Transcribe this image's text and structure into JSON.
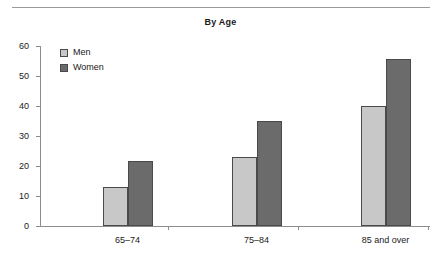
{
  "chart_data": {
    "type": "bar",
    "title": "By Age",
    "xlabel": "",
    "ylabel": "",
    "categories": [
      "65–74",
      "75–84",
      "85 and over"
    ],
    "series": [
      {
        "name": "Men",
        "values": [
          13,
          23,
          40
        ],
        "color": "#c8c8c8"
      },
      {
        "name": "Women",
        "values": [
          21.7,
          35,
          55.7
        ],
        "color": "#6b6b6b"
      }
    ],
    "ylim": [
      0,
      60
    ],
    "yticks": [
      0,
      10,
      20,
      30,
      40,
      50,
      60
    ],
    "ytick_labels": [
      "0",
      "10",
      "20",
      "30",
      "40",
      "50",
      "60"
    ],
    "grid": false,
    "legend_position": "top-left"
  },
  "legend": {
    "entries": [
      {
        "label": "Men"
      },
      {
        "label": "Women"
      }
    ]
  },
  "divider": {
    "name": "top-rule"
  }
}
